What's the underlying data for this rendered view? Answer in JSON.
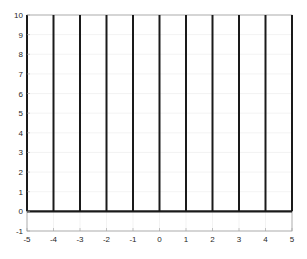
{
  "chart_data": {
    "type": "line",
    "title": "",
    "xlabel": "",
    "ylabel": "",
    "xlim": [
      -5,
      5
    ],
    "ylim": [
      -1,
      10
    ],
    "grid": true,
    "legend": null,
    "xticks": [
      "-5",
      "-4",
      "-3",
      "-2",
      "-1",
      "0",
      "1",
      "2",
      "3",
      "4",
      "5"
    ],
    "yticks": [
      "-1",
      "0",
      "1",
      "2",
      "3",
      "4",
      "5",
      "6",
      "7",
      "8",
      "9",
      "10"
    ],
    "series": [
      {
        "name": "stems",
        "description": "Vertical line segments from y=0 to y=10 at each integer x",
        "segments": [
          {
            "x": -5,
            "y0": 0,
            "y1": 10
          },
          {
            "x": -4,
            "y0": 0,
            "y1": 10
          },
          {
            "x": -3,
            "y0": 0,
            "y1": 10
          },
          {
            "x": -2,
            "y0": 0,
            "y1": 10
          },
          {
            "x": -1,
            "y0": 0,
            "y1": 10
          },
          {
            "x": 0,
            "y0": 0,
            "y1": 10
          },
          {
            "x": 1,
            "y0": 0,
            "y1": 10
          },
          {
            "x": 2,
            "y0": 0,
            "y1": 10
          },
          {
            "x": 3,
            "y0": 0,
            "y1": 10
          },
          {
            "x": 4,
            "y0": 0,
            "y1": 10
          },
          {
            "x": 5,
            "y0": 0,
            "y1": 10
          }
        ]
      },
      {
        "name": "baseline",
        "description": "Horizontal line at y=0 across full x range",
        "x": [
          -5,
          5
        ],
        "y": [
          0,
          0
        ]
      }
    ],
    "colors": {
      "line": "#1a1a1a",
      "grid": "#ebebeb",
      "axis": "#a0a0a0",
      "text": "#262626"
    }
  }
}
